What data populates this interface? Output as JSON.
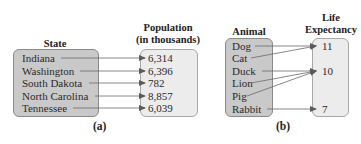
{
  "figures": [
    {
      "id": "a",
      "caption": "(a)",
      "domain_header": "State",
      "range_header_line1": "Population",
      "range_header_line2": "(in thousands)",
      "domain": [
        "Indiana",
        "Washington",
        "South Dakota",
        "North Carolina",
        "Tennessee"
      ],
      "range": [
        "6,314",
        "6,396",
        "782",
        "8,857",
        "6,039"
      ],
      "mapping": [
        {
          "from": "Indiana",
          "to": "6,314"
        },
        {
          "from": "Washington",
          "to": "6,396"
        },
        {
          "from": "South Dakota",
          "to": "782"
        },
        {
          "from": "North Carolina",
          "to": "8,857"
        },
        {
          "from": "Tennessee",
          "to": "6,039"
        }
      ]
    },
    {
      "id": "b",
      "caption": "(b)",
      "domain_header": "Animal",
      "range_header_line1": "Life",
      "range_header_line2": "Expectancy",
      "domain": [
        "Dog",
        "Cat",
        "Duck",
        "Lion",
        "Pig",
        "Rabbit"
      ],
      "range": [
        "11",
        "10",
        "7"
      ],
      "mapping": [
        {
          "from": "Dog",
          "to": "11"
        },
        {
          "from": "Cat",
          "to": "11"
        },
        {
          "from": "Duck",
          "to": "10"
        },
        {
          "from": "Lion",
          "to": "10"
        },
        {
          "from": "Pig",
          "to": "10"
        },
        {
          "from": "Rabbit",
          "to": "7"
        }
      ]
    }
  ],
  "colors": {
    "domain_box": "#c9c9c9",
    "range_box": "#ececec",
    "arrow": "#6a6a6a"
  }
}
